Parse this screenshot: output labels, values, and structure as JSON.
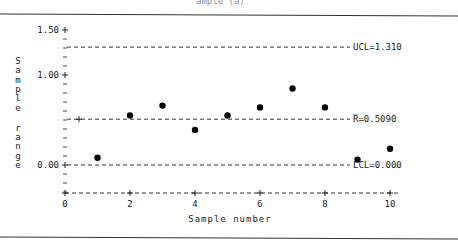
{
  "caption": "ample (a)",
  "chart_data": {
    "type": "scatter",
    "title": "",
    "xlabel": "Sample number",
    "ylabel": "Sample range",
    "x": [
      1,
      2,
      3,
      4,
      5,
      6,
      7,
      8,
      9,
      10
    ],
    "values": [
      0.08,
      0.55,
      0.66,
      0.39,
      0.55,
      0.64,
      0.85,
      0.64,
      0.06,
      0.18
    ],
    "xlim": [
      0,
      10.5
    ],
    "ylim": [
      -0.3,
      1.5
    ],
    "x_ticks": [
      0,
      2,
      4,
      6,
      8,
      10
    ],
    "x_tick_labels": [
      "0",
      "2",
      "4",
      "6",
      "8",
      "10"
    ],
    "y_ticks": [
      0.0,
      1.0,
      1.5
    ],
    "y_tick_labels": [
      "0.00",
      "1.00",
      "1.50"
    ],
    "y_minor_step": 0.1,
    "grid": false,
    "reference_lines": [
      {
        "name": "UCL",
        "value": 1.31,
        "label": "UCL=1.310"
      },
      {
        "name": "Rbar",
        "value": 0.509,
        "label": "R̅=0.5090"
      },
      {
        "name": "LCL",
        "value": 0.0,
        "label": "LCL=0.000"
      }
    ],
    "legend": null
  }
}
